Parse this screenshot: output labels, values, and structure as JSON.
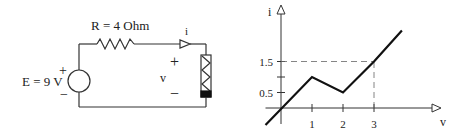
{
  "circuit": {
    "resistor_label": "R = 4 Ohm",
    "source_label": "E = 9 V",
    "source_plus": "+",
    "source_minus": "−",
    "current_label": "i",
    "voltage_label": "v",
    "voltage_plus": "+",
    "voltage_minus": "−"
  },
  "chart_data": {
    "type": "line",
    "title": "",
    "xlabel": "v",
    "ylabel": "i",
    "x_ticks": [
      1,
      2,
      3
    ],
    "x_tick_labels": [
      "1",
      "2",
      "3"
    ],
    "y_ticks": [
      0.5,
      1,
      1.5
    ],
    "y_tick_labels": [
      "0.5",
      "",
      "1.5"
    ],
    "xlim": [
      -0.5,
      5.2
    ],
    "ylim": [
      -0.6,
      3.4
    ],
    "series": [
      {
        "name": "i(v)",
        "points": [
          [
            -0.5,
            -0.55
          ],
          [
            1,
            1
          ],
          [
            2,
            0.5
          ],
          [
            3,
            1.5
          ],
          [
            3.9,
            2.5
          ]
        ]
      }
    ],
    "guides": [
      {
        "type": "dashed-horizontal",
        "y": 1.5,
        "x_from": 0,
        "x_to": 3
      },
      {
        "type": "dashed-vertical",
        "x": 3,
        "y_from": 0,
        "y_to": 1.5
      }
    ],
    "grid": false,
    "legend": "none"
  }
}
